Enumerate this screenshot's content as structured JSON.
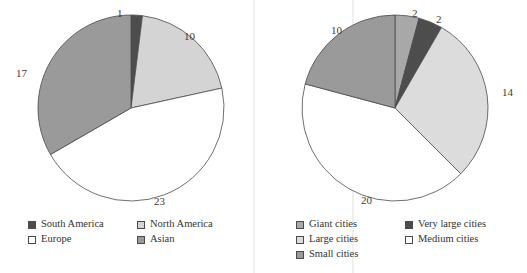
{
  "figure": {
    "background": "#ffffff",
    "text_color": "#3a3a3a"
  },
  "palette": {
    "dark_gray": "#4d4d4d",
    "medium_gray": "#9a9a9a",
    "light_gray": "#d4d4d4",
    "white": "#ffffff",
    "outline": "#4a4a4a"
  },
  "chart_data": [
    {
      "type": "pie",
      "id": "left-pie",
      "title": "",
      "labels": [
        "South America",
        "North America",
        "Europe",
        "Asian"
      ],
      "values": [
        1,
        10,
        23,
        17
      ],
      "total": 51,
      "colors": [
        "#4d4d4d",
        "#d4d4d4",
        "#ffffff",
        "#9a9a9a"
      ],
      "start_angle_deg": 0,
      "direction": "clockwise",
      "data_labels": [
        "1",
        "10",
        "23",
        "17"
      ],
      "legend": {
        "position": "bottom",
        "columns": 2,
        "entries": [
          {
            "label": "South America",
            "color": "#4d4d4d"
          },
          {
            "label": "North America",
            "color": "#d4d4d4"
          },
          {
            "label": "Europe",
            "color": "#ffffff"
          },
          {
            "label": "Asian",
            "color": "#9a9a9a"
          }
        ]
      }
    },
    {
      "type": "pie",
      "id": "right-pie",
      "title": "",
      "labels": [
        "Giant cities",
        "Very large cities",
        "Large cities",
        "Medium cities",
        "Small cities"
      ],
      "values": [
        2,
        2,
        14,
        20,
        10
      ],
      "total": 48,
      "colors": [
        "#a8a8a8",
        "#4d4d4d",
        "#dcdcdc",
        "#ffffff",
        "#9a9a9a"
      ],
      "start_angle_deg": 0,
      "direction": "clockwise",
      "data_labels": [
        "2",
        "2",
        "14",
        "20",
        "10"
      ],
      "legend": {
        "position": "bottom",
        "columns": 2,
        "entries": [
          {
            "label": "Giant cities",
            "color": "#a8a8a8"
          },
          {
            "label": "Very large cities",
            "color": "#4d4d4d"
          },
          {
            "label": "Large cities",
            "color": "#dcdcdc"
          },
          {
            "label": "Medium cities",
            "color": "#ffffff"
          },
          {
            "label": "Small cities",
            "color": "#9a9a9a"
          }
        ]
      }
    }
  ],
  "left": {
    "labels": {
      "l0": "1",
      "l1": "10",
      "l2": "23",
      "l3": "17"
    },
    "legend": {
      "e0": "South America",
      "e1": "North America",
      "e2": "Europe",
      "e3": "Asian"
    }
  },
  "right": {
    "labels": {
      "l0": "2",
      "l1": "2",
      "l2": "14",
      "l3": "20",
      "l4": "10"
    },
    "legend": {
      "e0": "Giant cities",
      "e1": "Very large cities",
      "e2": "Large cities",
      "e3": "Medium cities",
      "e4": "Small cities"
    }
  }
}
